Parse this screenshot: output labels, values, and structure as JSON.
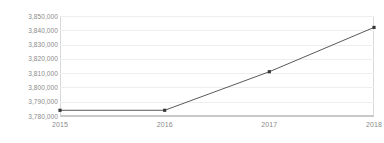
{
  "chart_data": {
    "type": "line",
    "title": "",
    "subtitle": "",
    "xlabel": "",
    "ylabel": "",
    "categories": [
      "2015",
      "2016",
      "2017",
      "2018"
    ],
    "x": [
      2015,
      2016,
      2017,
      2018
    ],
    "values": [
      3784000,
      3784000,
      3811000,
      3842000
    ],
    "series": [
      {
        "name": "",
        "values": [
          3784000,
          3784000,
          3811000,
          3842000
        ]
      }
    ],
    "ylim": [
      3780000,
      3850000
    ],
    "ytick_values": [
      3780000,
      3790000,
      3800000,
      3810000,
      3820000,
      3830000,
      3840000,
      3850000
    ],
    "ytick_labels": [
      "3,780,000",
      "3,790,000",
      "3,800,000",
      "3,810,000",
      "3,820,000",
      "3,830,000",
      "3,840,000",
      "3,850,000"
    ],
    "xtick_labels": [
      "2015",
      "2016",
      "2017",
      "2018"
    ],
    "grid": true,
    "grid_axis": "y",
    "legend": false,
    "legend_position": "none",
    "markers": true,
    "annotations": []
  },
  "style": {
    "line_color": "#5a5a5a",
    "marker_color": "#3a3a3a",
    "grid_color": "#eeeeee",
    "axis_color": "#c9c9c9",
    "tick_label_color": "#8a8a8a",
    "background": "#ffffff"
  }
}
